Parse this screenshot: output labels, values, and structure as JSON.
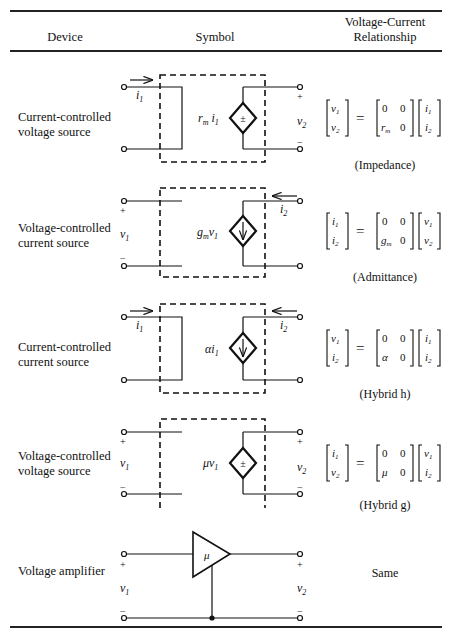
{
  "header": {
    "device": "Device",
    "symbol": "Symbol",
    "relationship_line1": "Voltage-Current",
    "relationship_line2": "Relationship"
  },
  "rows": [
    {
      "device_line1": "Current-controlled",
      "device_line2": "voltage source",
      "source_label": "r_m i_1",
      "source_glyph": "±",
      "caption": "(Impedance)",
      "lhs": [
        "v_1",
        "v_2"
      ],
      "matrix": [
        [
          "0",
          "0"
        ],
        [
          "r_m",
          "0"
        ]
      ],
      "rhs": [
        "i_1",
        "i_2"
      ]
    },
    {
      "device_line1": "Voltage-controlled",
      "device_line2": "current source",
      "source_label": "g_m v_1",
      "source_glyph": "↓",
      "caption": "(Admittance)",
      "lhs": [
        "i_1",
        "i_2"
      ],
      "matrix": [
        [
          "0",
          "0"
        ],
        [
          "g_m",
          "0"
        ]
      ],
      "rhs": [
        "v_1",
        "v_2"
      ]
    },
    {
      "device_line1": "Current-controlled",
      "device_line2": "current source",
      "source_label": "α i_1",
      "source_glyph": "↓",
      "caption": "(Hybrid h)",
      "lhs": [
        "v_1",
        "i_2"
      ],
      "matrix": [
        [
          "0",
          "0"
        ],
        [
          "α",
          "0"
        ]
      ],
      "rhs": [
        "i_1",
        "i_2"
      ]
    },
    {
      "device_line1": "Voltage-controlled",
      "device_line2": "voltage source",
      "source_label": "μ v_1",
      "source_glyph": "±",
      "caption": "(Hybrid g)",
      "lhs": [
        "i_1",
        "v_2"
      ],
      "matrix": [
        [
          "0",
          "0"
        ],
        [
          "μ",
          "0"
        ]
      ],
      "rhs": [
        "v_1",
        "i_2"
      ]
    },
    {
      "device_line1": "Voltage amplifier",
      "amp_gain": "μ",
      "relationship": "Same"
    }
  ],
  "labels": {
    "i": "i",
    "v": "v",
    "sub1": "1",
    "sub2": "2",
    "plus": "+",
    "minus": "−",
    "zero": "0",
    "eq": "=",
    "r": "r",
    "g": "g",
    "m": "m",
    "alpha": "α",
    "mu": "μ",
    "pm": "±",
    "down": "↓"
  }
}
